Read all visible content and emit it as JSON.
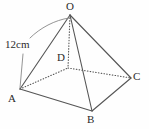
{
  "figure": {
    "type": "square-pyramid-diagram",
    "stroke_color": "#555555",
    "text_color": "#2b2b2b",
    "background_color": "#fefefe",
    "apex_label": "O",
    "base_labels": [
      "A",
      "B",
      "C",
      "D"
    ],
    "measurement": {
      "label": "12cm",
      "value": 12,
      "unit": "cm",
      "applies_to_edge": "OA"
    },
    "vertices": {
      "O": {
        "label": "O",
        "x": 70,
        "y": 15
      },
      "A": {
        "label": "A",
        "x": 20,
        "y": 89
      },
      "B": {
        "label": "B",
        "x": 92,
        "y": 111
      },
      "C": {
        "label": "C",
        "x": 131,
        "y": 78
      },
      "D": {
        "label": "D",
        "x": 68,
        "y": 68
      }
    },
    "edges": [
      {
        "name": "OA",
        "from": "O",
        "to": "A",
        "style": "solid"
      },
      {
        "name": "OB",
        "from": "O",
        "to": "B",
        "style": "solid"
      },
      {
        "name": "OC",
        "from": "O",
        "to": "C",
        "style": "solid"
      },
      {
        "name": "OD",
        "from": "O",
        "to": "D",
        "style": "dotted"
      },
      {
        "name": "AB",
        "from": "A",
        "to": "B",
        "style": "solid"
      },
      {
        "name": "BC",
        "from": "B",
        "to": "C",
        "style": "solid"
      },
      {
        "name": "AD",
        "from": "A",
        "to": "D",
        "style": "dotted"
      },
      {
        "name": "DC",
        "from": "D",
        "to": "C",
        "style": "dotted"
      }
    ]
  }
}
